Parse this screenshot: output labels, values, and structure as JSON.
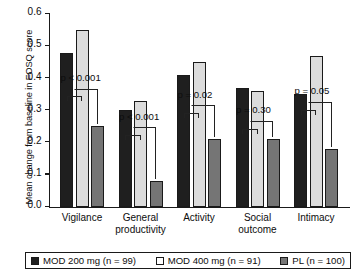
{
  "chart_data": {
    "type": "bar",
    "title": "",
    "xlabel": "",
    "ylabel": "Mean change from baseline in FOSQ score",
    "ylim": [
      0.0,
      0.6
    ],
    "grid": false,
    "legend_position": "bottom",
    "ytick_labels": [
      "0.0",
      "0.1",
      "0.2",
      "0.3",
      "0.4",
      "0.5",
      "0.6"
    ],
    "ytick_values": [
      0.0,
      0.1,
      0.2,
      0.3,
      0.4,
      0.5,
      0.6
    ],
    "categories": [
      "Vigilance",
      "General productivity",
      "Activity",
      "Social outcome",
      "Intimacy"
    ],
    "category_lines": [
      [
        "Vigilance"
      ],
      [
        "General",
        "productivity"
      ],
      [
        "Activity"
      ],
      [
        "Social",
        "outcome"
      ],
      [
        "Intimacy"
      ]
    ],
    "series": [
      {
        "name": "MOD 200 mg (n = 99)",
        "color": "#1f1f1f",
        "values": [
          0.48,
          0.3,
          0.41,
          0.37,
          0.35
        ]
      },
      {
        "name": "MOD 400 mg (n = 91)",
        "color": "#dcdcdc",
        "values": [
          0.55,
          0.33,
          0.45,
          0.36,
          0.47
        ]
      },
      {
        "name": "PL (n = 100)",
        "color": "#757575",
        "values": [
          0.25,
          0.08,
          0.21,
          0.21,
          0.18
        ]
      }
    ],
    "annotations": [
      {
        "category": "Vigilance",
        "text": "p < 0.001"
      },
      {
        "category": "General productivity",
        "text": "p < 0.001"
      },
      {
        "category": "Activity",
        "text": "p = 0.02"
      },
      {
        "category": "Social outcome",
        "text": "p = 0.30"
      },
      {
        "category": "Intimacy",
        "text": "p = 0.05"
      }
    ]
  },
  "legend": {
    "items": [
      {
        "label": "MOD 200 mg (n = 99)",
        "swatch": "filled-black-swatch"
      },
      {
        "label": "MOD 400 mg (n = 91)",
        "swatch": "open-white-swatch"
      },
      {
        "label": "PL (n = 100)",
        "swatch": "filled-gray-swatch"
      }
    ]
  }
}
